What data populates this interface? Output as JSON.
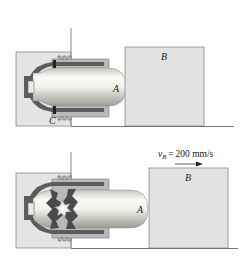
{
  "figure": {
    "top_panel": {
      "labels": {
        "capsule": "A",
        "block": "B",
        "latch": "C"
      }
    },
    "bottom_panel": {
      "labels": {
        "capsule": "A",
        "block": "B"
      },
      "velocity": {
        "symbol": "v",
        "subscript": "B",
        "equals": "=",
        "value": "200 mm/s"
      }
    },
    "colors": {
      "box_fill": "#e4e4e4",
      "box_stroke": "#8a8a8a",
      "housing_fill": "#b9b9b9",
      "housing_dark": "#5c5c5c",
      "capsule_light": "#f7f7f2",
      "capsule_shadow": "#b8b8b0",
      "block_fill": "#e2e2e2",
      "ground": "#777777",
      "explosion_dark": "#4a4a4a"
    }
  }
}
